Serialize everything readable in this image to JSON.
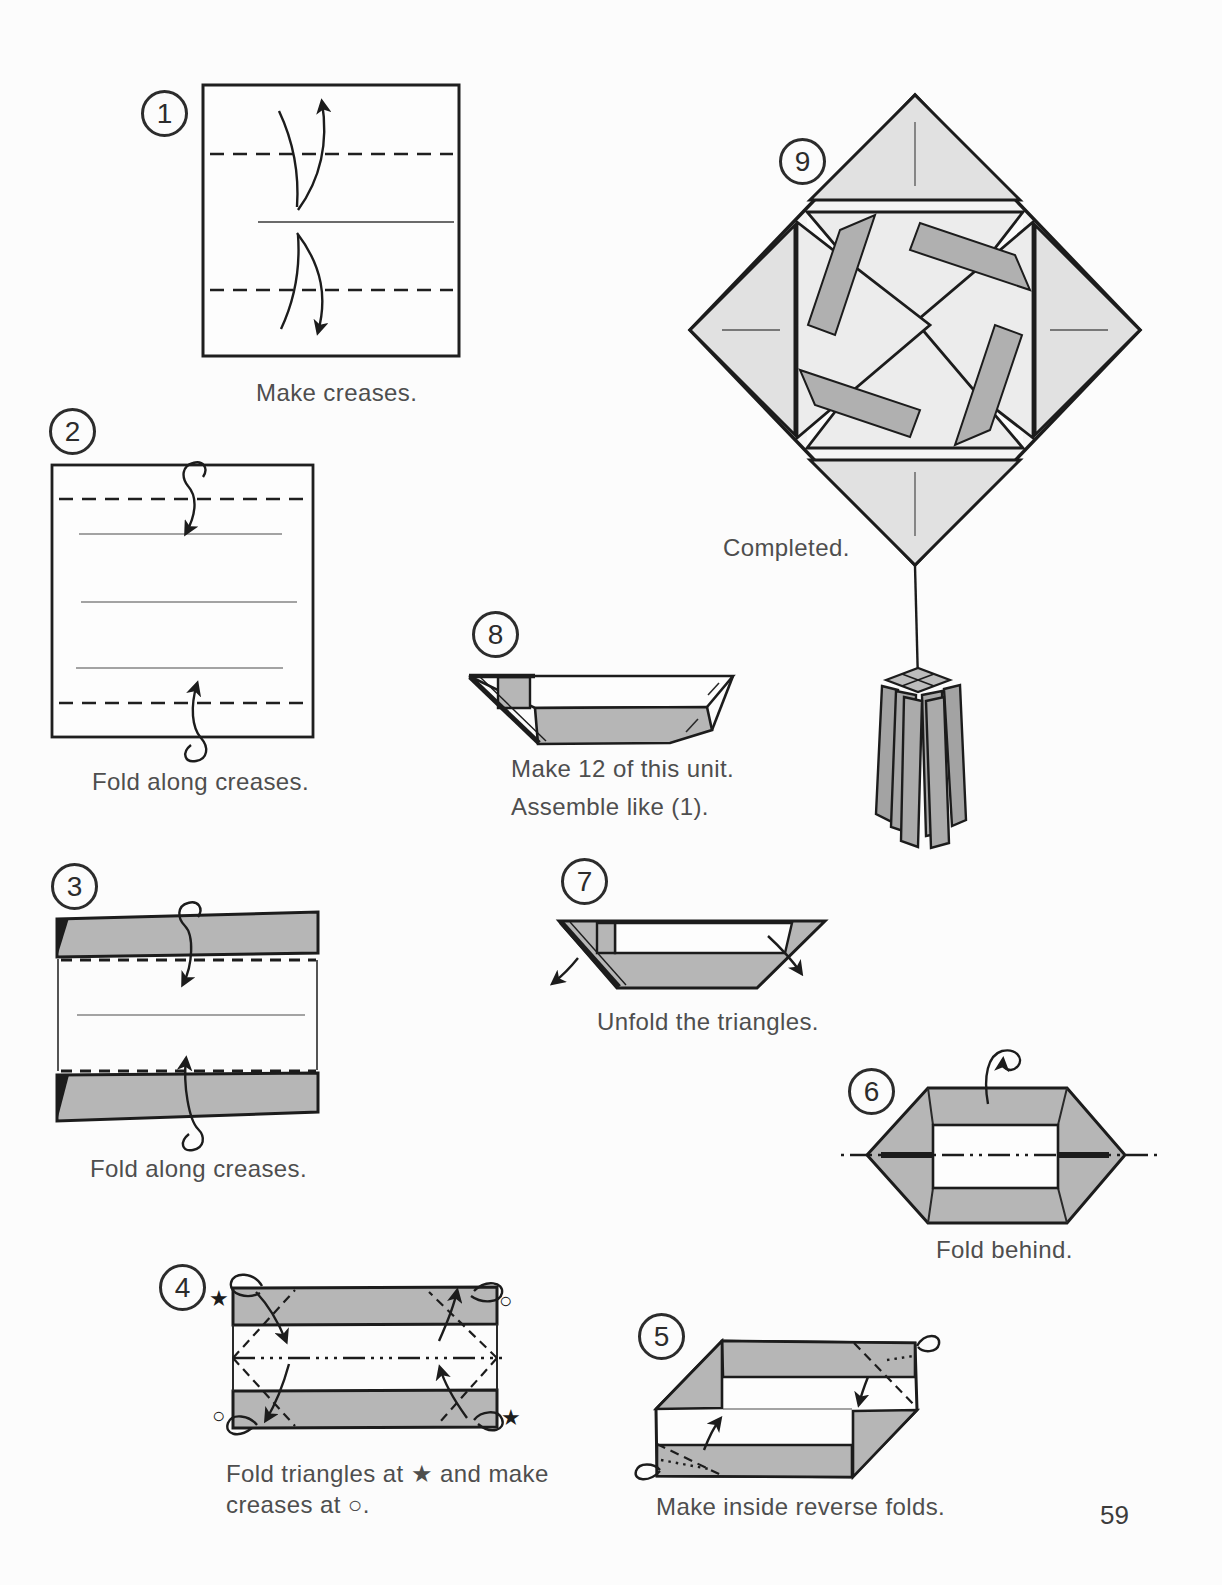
{
  "page": {
    "number": "59"
  },
  "colors": {
    "outline": "#1c1c1c",
    "paper_gray": "#b6b6b6",
    "model_light_gray": "#e1e1e1",
    "model_mid_gray": "#b0b0b0",
    "caption_text": "#4e4e4e",
    "background": "#fcfcfc"
  },
  "steps": [
    {
      "number": "1",
      "caption": "Make creases."
    },
    {
      "number": "2",
      "caption": "Fold along creases."
    },
    {
      "number": "3",
      "caption": "Fold along creases."
    },
    {
      "number": "4",
      "caption_line1": "Fold triangles at ★ and make",
      "caption_line2": "creases at ○.",
      "symbol_star": "★",
      "symbol_circle": "○"
    },
    {
      "number": "5",
      "caption": "Make inside reverse folds."
    },
    {
      "number": "6",
      "caption": "Fold behind."
    },
    {
      "number": "7",
      "caption": "Unfold the triangles."
    },
    {
      "number": "8",
      "caption_line1": "Make 12 of this unit.",
      "caption_line2": "Assemble like (1)."
    },
    {
      "number": "9",
      "caption": "Completed."
    }
  ]
}
